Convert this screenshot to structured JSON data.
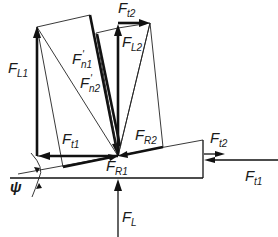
{
  "diagram": {
    "title": "",
    "labels": {
      "FL1": {
        "main": "F",
        "sub": "L1"
      },
      "Fn1p": {
        "main": "F",
        "sub": "n1",
        "prime": "'"
      },
      "Fn2p": {
        "main": "F",
        "sub": "n2",
        "prime": "'"
      },
      "Ft2_top": {
        "main": "F",
        "sub": "t2"
      },
      "FL2": {
        "main": "F",
        "sub": "L2"
      },
      "Ft1_left": {
        "main": "F",
        "sub": "t1"
      },
      "FR2": {
        "main": "F",
        "sub": "R2"
      },
      "FR1": {
        "main": "F",
        "sub": "R1"
      },
      "Ft2_right": {
        "main": "F",
        "sub": "t2"
      },
      "Ft1_right": {
        "main": "F",
        "sub": "t1"
      },
      "FL": {
        "main": "F",
        "sub": "L"
      },
      "psi": {
        "main": "ψ"
      }
    },
    "vectors": [
      {
        "name": "FL1",
        "description": "vertical force on left"
      },
      {
        "name": "Fn1'",
        "description": "normal force 1 (thick slanted)"
      },
      {
        "name": "Fn2'",
        "description": "normal force 2 (thick slanted)"
      },
      {
        "name": "Ft2",
        "description": "tangential force 2 (top, horizontal)"
      },
      {
        "name": "FL2",
        "description": "vertical force center"
      },
      {
        "name": "Ft1",
        "description": "tangential force 1 (left, horizontal)"
      },
      {
        "name": "FR1",
        "description": "resultant 1 along incline"
      },
      {
        "name": "FR2",
        "description": "resultant 2 along incline"
      },
      {
        "name": "FL",
        "description": "vertical load from below"
      },
      {
        "name": "Ft2 (wedge)",
        "description": "force on wedge right side, to right"
      },
      {
        "name": "Ft1 (wedge)",
        "description": "force on wedge right side, to left"
      }
    ],
    "angle": {
      "name": "psi",
      "symbol": "ψ",
      "description": "incline angle of wedge"
    }
  }
}
